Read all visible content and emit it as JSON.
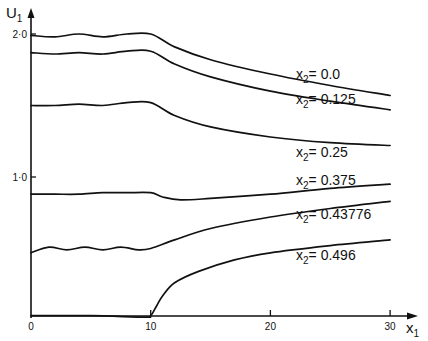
{
  "chart_data": {
    "type": "line",
    "title": "",
    "xlabel": "x1",
    "ylabel": "U1",
    "xlim": [
      0,
      31
    ],
    "ylim": [
      0,
      2.1
    ],
    "grid": false,
    "legend": "inline labels at right end of each curve",
    "x_ticks": [
      "0",
      "10",
      "20",
      "30"
    ],
    "y_ticks": [
      "1·0",
      "2·0"
    ],
    "series": [
      {
        "name": "x2=0.0",
        "label_prefix": "x",
        "label_sub": "2",
        "label_value": "= 0.0",
        "x": [
          0,
          2,
          4,
          6,
          8,
          10,
          12,
          15,
          20,
          25,
          30
        ],
        "y": [
          1.99,
          1.98,
          2.0,
          1.98,
          2.0,
          2.0,
          1.91,
          1.82,
          1.72,
          1.64,
          1.57
        ]
      },
      {
        "name": "x2=0.125",
        "label_prefix": "x",
        "label_sub": "2",
        "label_value": "= 0.125",
        "x": [
          0,
          2,
          4,
          6,
          8,
          10,
          12,
          15,
          20,
          25,
          30
        ],
        "y": [
          1.87,
          1.86,
          1.87,
          1.86,
          1.88,
          1.88,
          1.79,
          1.7,
          1.6,
          1.53,
          1.47
        ]
      },
      {
        "name": "x2=0.25",
        "label_prefix": "x",
        "label_sub": "2",
        "label_value": "= 0.25",
        "x": [
          0,
          2,
          4,
          6,
          8,
          10,
          12,
          15,
          20,
          25,
          30
        ],
        "y": [
          1.5,
          1.5,
          1.51,
          1.5,
          1.52,
          1.52,
          1.43,
          1.35,
          1.28,
          1.24,
          1.22
        ]
      },
      {
        "name": "x2=0.375",
        "label_prefix": "x",
        "label_sub": "2",
        "label_value": "= 0.375",
        "x": [
          0,
          2,
          4,
          6,
          8,
          10,
          11,
          12.5,
          15,
          20,
          25,
          30
        ],
        "y": [
          0.88,
          0.88,
          0.88,
          0.89,
          0.89,
          0.89,
          0.86,
          0.84,
          0.85,
          0.88,
          0.92,
          0.95
        ]
      },
      {
        "name": "x2=0.43776",
        "label_prefix": "x",
        "label_sub": "2",
        "label_value": "= 0.43776",
        "x": [
          0,
          1.5,
          3,
          4.5,
          6,
          7.5,
          9,
          10,
          12,
          15,
          20,
          25,
          30
        ],
        "y": [
          0.47,
          0.51,
          0.49,
          0.51,
          0.49,
          0.51,
          0.49,
          0.5,
          0.56,
          0.64,
          0.72,
          0.78,
          0.83
        ]
      },
      {
        "name": "x2=0.496",
        "label_prefix": "x",
        "label_sub": "2",
        "label_value": "= 0.496",
        "x": [
          0,
          5,
          9.5,
          10,
          10.5,
          11,
          12,
          14,
          17,
          20,
          25,
          30
        ],
        "y": [
          0.03,
          0.03,
          0.02,
          0.03,
          0.1,
          0.17,
          0.26,
          0.34,
          0.42,
          0.47,
          0.52,
          0.56
        ]
      }
    ]
  },
  "axes": {
    "y_label_main": "U",
    "y_label_sub": "1",
    "x_label_main": "x",
    "x_label_sub": "1",
    "y_tick_labels": [
      "1·0",
      "2·0"
    ],
    "x_tick_labels": [
      "0",
      "10",
      "20",
      "30"
    ]
  }
}
